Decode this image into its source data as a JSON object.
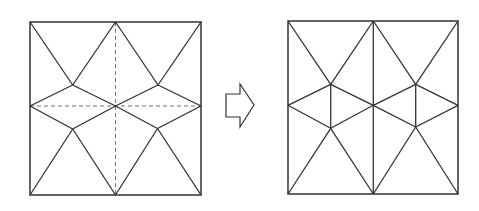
{
  "diagram": {
    "colors": {
      "stroke": "#333333",
      "dashed": "#777777",
      "background": "#ffffff"
    },
    "left_figure": {
      "square": {
        "x": 30,
        "y": 22,
        "w": 171,
        "h": 173
      },
      "solid_lines": [
        [
          30,
          22,
          72.7,
          85
        ],
        [
          115.5,
          22,
          72.7,
          85
        ],
        [
          115.5,
          22,
          158,
          85
        ],
        [
          201,
          22,
          158,
          85
        ],
        [
          30,
          106,
          72.7,
          85
        ],
        [
          72.7,
          85,
          115.5,
          106
        ],
        [
          115.5,
          106,
          158,
          85
        ],
        [
          158,
          85,
          201,
          106
        ],
        [
          30,
          106,
          72.7,
          129
        ],
        [
          72.7,
          129,
          115.5,
          106
        ],
        [
          115.5,
          106,
          157.5,
          128.5
        ],
        [
          157.5,
          128.5,
          201,
          106
        ],
        [
          72.7,
          129,
          30,
          195
        ],
        [
          72.7,
          129,
          115.5,
          195
        ],
        [
          157.5,
          128.5,
          115.5,
          195
        ],
        [
          157.5,
          128.5,
          201,
          195
        ]
      ],
      "dashed_lines": [
        [
          115.5,
          22,
          115.5,
          195
        ],
        [
          30,
          106,
          201,
          106
        ]
      ]
    },
    "arrow": {
      "direction": "right",
      "points": "226,94 240,94 240,84 254,105 240,127 240,117 226,117"
    },
    "right_figure": {
      "square": {
        "x": 288,
        "y": 21,
        "w": 170,
        "h": 173
      },
      "solid_lines": [
        [
          288,
          21,
          330.7,
          84.3
        ],
        [
          373.3,
          21,
          330.7,
          84.3
        ],
        [
          373.3,
          21,
          415.7,
          84.3
        ],
        [
          458,
          21,
          415.7,
          84.3
        ],
        [
          288,
          105.3,
          330.7,
          84.3
        ],
        [
          330.7,
          84.3,
          373.3,
          105.3
        ],
        [
          373.3,
          105.3,
          415.7,
          84.3
        ],
        [
          415.7,
          84.3,
          458,
          105.3
        ],
        [
          288,
          105.3,
          330.7,
          128.3
        ],
        [
          330.7,
          128.3,
          373.3,
          105.3
        ],
        [
          373.3,
          105.3,
          415.7,
          127
        ],
        [
          415.7,
          127,
          458,
          105.3
        ],
        [
          330.7,
          128.3,
          288,
          194
        ],
        [
          330.7,
          128.3,
          373.3,
          194
        ],
        [
          415.7,
          127,
          373.3,
          194
        ],
        [
          415.7,
          127,
          458,
          194
        ],
        [
          373.3,
          21,
          373.3,
          194
        ],
        [
          330.7,
          84.3,
          330.7,
          128.3
        ],
        [
          415.7,
          84.3,
          415.7,
          127
        ]
      ],
      "dashed_lines": []
    }
  }
}
